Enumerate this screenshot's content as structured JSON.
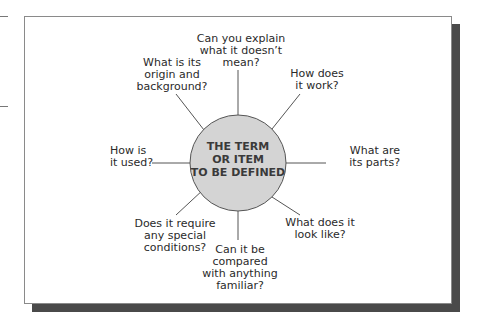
{
  "diagram": {
    "center": {
      "label": "THE TERM\nOR ITEM\nTO BE DEFINED",
      "fill": "#d4d4d4"
    },
    "spokes": [
      {
        "id": "explain-negative",
        "label": "Can you explain\nwhat it doesn’t\nmean?"
      },
      {
        "id": "how-work",
        "label": "How does\nit work?"
      },
      {
        "id": "parts",
        "label": "What are\nits parts?"
      },
      {
        "id": "look-like",
        "label": "What does it\nlook like?"
      },
      {
        "id": "compared",
        "label": "Can it be\ncompared\nwith anything\nfamiliar?"
      },
      {
        "id": "special-conditions",
        "label": "Does it require\nany special\nconditions?"
      },
      {
        "id": "how-used",
        "label": "How is\nit used?"
      },
      {
        "id": "origin",
        "label": "What is its\norigin and\nbackground?"
      }
    ]
  }
}
